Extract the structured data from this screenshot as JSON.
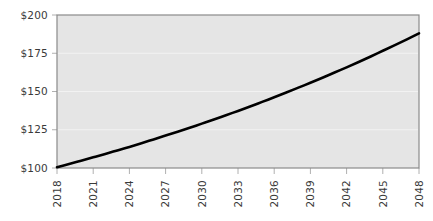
{
  "chart_data": {
    "type": "line",
    "title": "",
    "subtitle": "",
    "xlabel": "",
    "ylabel": "",
    "grid": true,
    "grid_axis": "y",
    "legend": "none",
    "xlim": [
      2018,
      2048
    ],
    "ylim": [
      100,
      200
    ],
    "x_tick_labels": [
      "2018",
      "2021",
      "2024",
      "2027",
      "2030",
      "2033",
      "2036",
      "2039",
      "2042",
      "2045",
      "2048"
    ],
    "x_tick_values": [
      2018,
      2021,
      2024,
      2027,
      2030,
      2033,
      2036,
      2039,
      2042,
      2045,
      2048
    ],
    "x_tick_rotation": 90,
    "y_tick_labels": [
      "$100",
      "$125",
      "$150",
      "$175",
      "$200"
    ],
    "y_tick_values": [
      100,
      125,
      150,
      175,
      200
    ],
    "series": [
      {
        "name": "value",
        "x": [
          2018,
          2019,
          2020,
          2021,
          2022,
          2023,
          2024,
          2025,
          2026,
          2027,
          2028,
          2029,
          2030,
          2031,
          2032,
          2033,
          2034,
          2035,
          2036,
          2037,
          2038,
          2039,
          2040,
          2041,
          2042,
          2043,
          2044,
          2045,
          2046,
          2047,
          2048
        ],
        "values": [
          100.5,
          102.6,
          104.8,
          107.0,
          109.2,
          111.5,
          113.8,
          116.2,
          118.7,
          121.2,
          123.7,
          126.3,
          129.0,
          131.7,
          134.5,
          137.3,
          140.2,
          143.2,
          146.2,
          149.3,
          152.5,
          155.7,
          159.0,
          162.4,
          165.8,
          169.3,
          172.9,
          176.6,
          180.3,
          184.1,
          188.0
        ]
      }
    ],
    "colors": {
      "line": "#000000",
      "plot_background": "#e5e5e5",
      "page_background": "#ffffff",
      "gridline": "#f2f2f2",
      "axis_border": "#8a8a8a",
      "tick_label": "#3a3a3a"
    }
  }
}
